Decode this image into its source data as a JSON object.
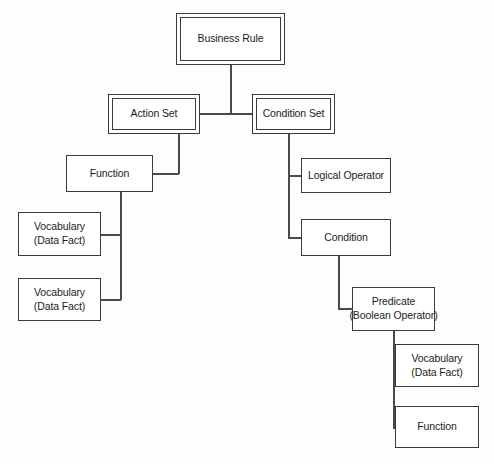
{
  "diagram": {
    "type": "tree-hierarchy-diagram",
    "background_color": "#fdfdfd",
    "line_color": "#4a4a4a",
    "box_border_color": "#3a3a3a",
    "box_fill_color": "#ffffff",
    "text_color": "#1c1c1c",
    "nodes": [
      {
        "id": "business-rule",
        "label_line1": "Business Rule",
        "label_line2": "",
        "border_style": "double",
        "x": 176,
        "y": 13,
        "w": 109,
        "h": 52
      },
      {
        "id": "action-set",
        "label_line1": "Action Set",
        "label_line2": "",
        "border_style": "double",
        "x": 108,
        "y": 94,
        "w": 92,
        "h": 40
      },
      {
        "id": "condition-set",
        "label_line1": "Condition Set",
        "label_line2": "",
        "border_style": "double",
        "x": 252,
        "y": 94,
        "w": 83,
        "h": 40
      },
      {
        "id": "function-left",
        "label_line1": "Function",
        "label_line2": "",
        "border_style": "single",
        "x": 66,
        "y": 155,
        "w": 87,
        "h": 37
      },
      {
        "id": "logical-operator",
        "label_line1": "Logical Operator",
        "label_line2": "",
        "border_style": "single",
        "x": 301,
        "y": 158,
        "w": 90,
        "h": 35
      },
      {
        "id": "vocabulary-1",
        "label_line1": "Vocabulary",
        "label_line2": "(Data Fact)",
        "border_style": "single",
        "x": 18,
        "y": 212,
        "w": 83,
        "h": 44
      },
      {
        "id": "condition",
        "label_line1": "Condition",
        "label_line2": "",
        "border_style": "single",
        "x": 301,
        "y": 219,
        "w": 90,
        "h": 37
      },
      {
        "id": "vocabulary-2",
        "label_line1": "Vocabulary",
        "label_line2": "(Data Fact)",
        "border_style": "single",
        "x": 18,
        "y": 278,
        "w": 83,
        "h": 43
      },
      {
        "id": "predicate",
        "label_line1": "Predicate",
        "label_line2": "(Boolean Operator)",
        "border_style": "single",
        "x": 352,
        "y": 287,
        "w": 83,
        "h": 44
      },
      {
        "id": "vocabulary-3",
        "label_line1": "Vocabulary",
        "label_line2": "(Data Fact)",
        "border_style": "single",
        "x": 395,
        "y": 344,
        "w": 84,
        "h": 43
      },
      {
        "id": "function-right",
        "label_line1": "Function",
        "label_line2": "",
        "border_style": "single",
        "x": 395,
        "y": 406,
        "w": 84,
        "h": 42
      }
    ],
    "connectors": [
      {
        "id": "br-down",
        "orient": "v",
        "x": 230,
        "y": 65,
        "len": 48
      },
      {
        "id": "br-split-h",
        "orient": "h",
        "x": 154,
        "y": 113,
        "len": 99
      },
      {
        "id": "actionset-down",
        "orient": "v",
        "x": 154,
        "y": 113,
        "len": 1
      },
      {
        "id": "as-to-fn-down",
        "orient": "v",
        "x": 178,
        "y": 134,
        "len": 40
      },
      {
        "id": "as-to-fn-h",
        "orient": "h",
        "x": 152,
        "y": 173,
        "len": 27
      },
      {
        "id": "fn-down-left",
        "orient": "v",
        "x": 120,
        "y": 192,
        "len": 108
      },
      {
        "id": "fn-to-voc1-h",
        "orient": "h",
        "x": 100,
        "y": 234,
        "len": 21
      },
      {
        "id": "fn-to-voc2-h",
        "orient": "h",
        "x": 100,
        "y": 299,
        "len": 21
      },
      {
        "id": "cs-down-right",
        "orient": "v",
        "x": 288,
        "y": 134,
        "len": 104
      },
      {
        "id": "cs-to-logop-h",
        "orient": "h",
        "x": 288,
        "y": 175,
        "len": 14
      },
      {
        "id": "cs-to-cond-h",
        "orient": "h",
        "x": 288,
        "y": 237,
        "len": 14
      },
      {
        "id": "cond-down",
        "orient": "v",
        "x": 338,
        "y": 256,
        "len": 54
      },
      {
        "id": "cond-to-pred-h",
        "orient": "h",
        "x": 338,
        "y": 308,
        "len": 15
      },
      {
        "id": "pred-down",
        "orient": "v",
        "x": 393,
        "y": 331,
        "len": 97
      },
      {
        "id": "pred-to-voc3-h",
        "orient": "h",
        "x": 393,
        "y": 365,
        "len": 4
      },
      {
        "id": "pred-to-fnright-h",
        "orient": "h",
        "x": 393,
        "y": 427,
        "len": 4
      }
    ]
  }
}
